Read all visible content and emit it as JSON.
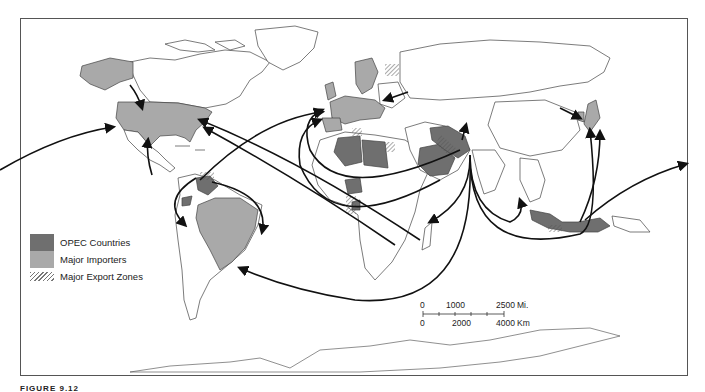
{
  "legend": {
    "items": [
      {
        "label": "OPEC Countries",
        "color": "#6f6f6f"
      },
      {
        "label": "Major Importers",
        "color": "#a9a9a9"
      },
      {
        "label": "Major Export Zones",
        "pattern": "diagonal-hatch"
      }
    ]
  },
  "scale_bar": {
    "miles": {
      "start": "0",
      "mid": "1000",
      "end": "2500",
      "unit": "Mi."
    },
    "km": {
      "start": "0",
      "mid": "2000",
      "end": "4000",
      "unit": "Km"
    }
  },
  "caption": {
    "text": "FIGURE 9.12"
  },
  "colors": {
    "opec": "#6f6f6f",
    "importer": "#a9a9a9",
    "outline": "#444444",
    "arrow": "#111111",
    "frame": "#555555"
  }
}
